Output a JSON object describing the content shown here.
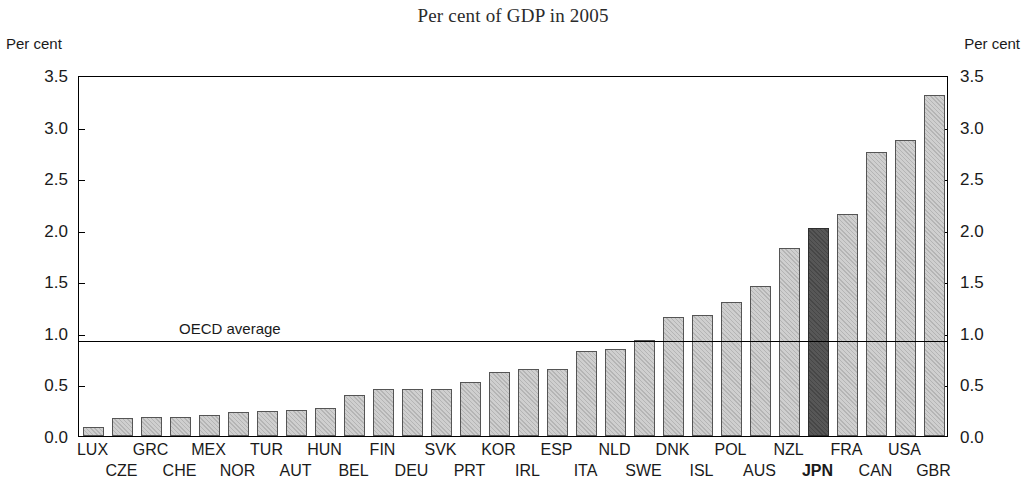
{
  "chart_data": {
    "type": "bar",
    "title": "Per cent of GDP in 2005",
    "xlabel": "",
    "ylabel": "Per cent",
    "ylabel_right": "Per cent",
    "ylim": [
      0.0,
      3.5
    ],
    "yticks": [
      "0.0",
      "0.5",
      "1.0",
      "1.5",
      "2.0",
      "2.5",
      "3.0",
      "3.5"
    ],
    "ytick_values": [
      0.0,
      0.5,
      1.0,
      1.5,
      2.0,
      2.5,
      3.0,
      3.5
    ],
    "grid": false,
    "legend": null,
    "categories": [
      "LUX",
      "CZE",
      "GRC",
      "CHE",
      "MEX",
      "NOR",
      "TUR",
      "AUT",
      "HUN",
      "BEL",
      "FIN",
      "DEU",
      "SVK",
      "PRT",
      "KOR",
      "IRL",
      "ESP",
      "ITA",
      "NLD",
      "SWE",
      "DNK",
      "ISL",
      "POL",
      "AUS",
      "NZL",
      "JPN",
      "FRA",
      "CAN",
      "USA",
      "GBR"
    ],
    "values": [
      0.09,
      0.17,
      0.18,
      0.18,
      0.2,
      0.23,
      0.24,
      0.25,
      0.27,
      0.4,
      0.46,
      0.46,
      0.46,
      0.52,
      0.62,
      0.65,
      0.65,
      0.82,
      0.84,
      0.93,
      1.15,
      1.17,
      1.3,
      1.45,
      1.82,
      2.02,
      2.15,
      2.75,
      2.87,
      3.31
    ],
    "highlight_category": "JPN",
    "highlight_color": "#575757",
    "bar_color": "#cfcfcf",
    "bar_border_color": "#555555",
    "annotations": [
      {
        "name": "oecd-average-line",
        "label": "OECD average",
        "value": 0.94,
        "kind": "hline"
      }
    ]
  }
}
